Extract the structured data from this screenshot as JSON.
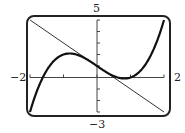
{
  "chart_data": {
    "type": "line",
    "title": "",
    "xlabel": "",
    "ylabel": "",
    "xlim": [
      -2,
      2
    ],
    "ylim": [
      -3,
      5
    ],
    "grid": false,
    "tick_labels": {
      "xmin": "−2",
      "xmax": "2",
      "ymin": "−3",
      "ymax": "5"
    },
    "x_ticks": [
      -2,
      -1,
      0,
      1,
      2
    ],
    "y_ticks": [
      -3,
      -2,
      -1,
      0,
      1,
      2,
      3,
      4,
      5
    ],
    "series": [
      {
        "name": "curve",
        "description": "cubic f(x) = x^3 - 2x + 1",
        "style": "thick",
        "x": [
          -2,
          -1.5,
          -1,
          -0.816,
          -0.5,
          0,
          0.5,
          0.816,
          1,
          1.5,
          2
        ],
        "y": [
          -3,
          1.625,
          2,
          2.09,
          1.875,
          1,
          0.125,
          -0.089,
          0,
          1.375,
          5
        ]
      },
      {
        "name": "tangent line",
        "description": "y = -2x + 1",
        "style": "thin",
        "x": [
          -2,
          2
        ],
        "y": [
          5,
          -3
        ]
      }
    ]
  },
  "labels": {
    "ymax": "5",
    "ymin": "−3",
    "xmin": "−2",
    "xmax": "2"
  }
}
